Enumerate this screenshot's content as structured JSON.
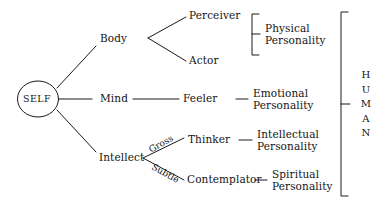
{
  "diagram": {
    "root": {
      "label": "SELF",
      "shape": "ellipse"
    },
    "levels": {
      "aspects": [
        {
          "label": "Body"
        },
        {
          "label": "Mind"
        },
        {
          "label": "Intellect"
        }
      ],
      "faculties": [
        {
          "label": "Perceiver"
        },
        {
          "label": "Actor"
        },
        {
          "label": "Feeler"
        },
        {
          "label": "Thinker"
        },
        {
          "label": "Contemplator"
        }
      ],
      "personalities": [
        {
          "line1": "Physical",
          "line2": "Personality"
        },
        {
          "line1": "Emotional",
          "line2": "Personality"
        },
        {
          "line1": "Intellectual",
          "line2": "Personality"
        },
        {
          "line1": "Spiritual",
          "line2": "Personality"
        }
      ]
    },
    "branch_labels": [
      {
        "label": "Gross"
      },
      {
        "label": "Subtle"
      }
    ],
    "grouping": {
      "label": "HUMAN",
      "letters": [
        "H",
        "U",
        "M",
        "A",
        "N"
      ]
    },
    "colors": {
      "line": "#1a1a1a",
      "text": "#141414",
      "background": "#ffffff"
    }
  }
}
